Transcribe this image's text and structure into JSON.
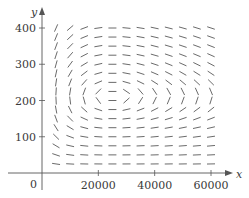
{
  "chart_data": {
    "type": "direction_field",
    "title": "",
    "xlabel": "x",
    "ylabel": "y",
    "origin_label": "0",
    "xlim": [
      0,
      65000
    ],
    "ylim": [
      0,
      430
    ],
    "x_ticks": [
      20000,
      40000,
      60000
    ],
    "x_tick_labels": [
      "20000",
      "40000",
      "60000"
    ],
    "y_ticks": [
      100,
      200,
      300,
      400
    ],
    "y_tick_labels": [
      "100",
      "200",
      "300",
      "400"
    ],
    "grid": false,
    "legend": null,
    "field": {
      "description": "Predator-prey direction field: dx/dt = a*x*(1 - y/Y0), dy/dt = -b*y*(1 - x/X0)",
      "equilibrium": {
        "x": 25000,
        "y": 210
      },
      "a": 0.08,
      "b": 0.02,
      "grid_x": [
        5000,
        10000,
        15000,
        20000,
        25000,
        30000,
        35000,
        40000,
        45000,
        50000,
        55000,
        60000
      ],
      "grid_y": [
        25,
        50,
        75,
        100,
        125,
        150,
        175,
        200,
        225,
        250,
        275,
        300,
        325,
        350,
        375,
        400
      ],
      "segment_length_px": 8
    },
    "colors": {
      "axis": "#555555",
      "segments": "#444444",
      "text": "#3a3a3a"
    }
  }
}
